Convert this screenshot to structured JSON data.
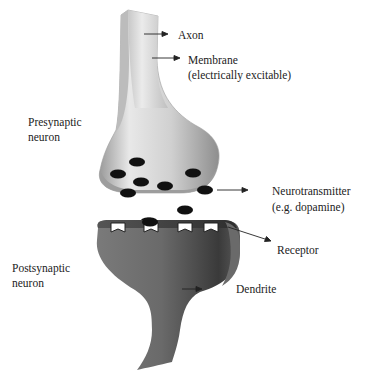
{
  "diagram": {
    "type": "synapse-illustration",
    "labels": {
      "axon": "Axon",
      "membrane": "Membrane",
      "membrane_note": "(electrically excitable)",
      "presynaptic_line1": "Presynaptic",
      "presynaptic_line2": "neuron",
      "neurotransmitter": "Neurotransmitter",
      "neurotransmitter_note": "(e.g. dopamine)",
      "receptor": "Receptor",
      "postsynaptic_line1": "Postsynaptic",
      "postsynaptic_line2": "neuron",
      "dendrite": "Dendrite"
    },
    "colors": {
      "presynaptic_light": "#e6e6e6",
      "presynaptic_mid": "#b8b8b8",
      "presynaptic_dark": "#8c8c8c",
      "postsynaptic_light": "#8a8a8a",
      "postsynaptic_dark": "#3c3c3c",
      "vesicle": "#111111",
      "receptor": "#ffffff",
      "text": "#222222"
    },
    "vesicle_count": 9,
    "receptor_count": 4
  }
}
